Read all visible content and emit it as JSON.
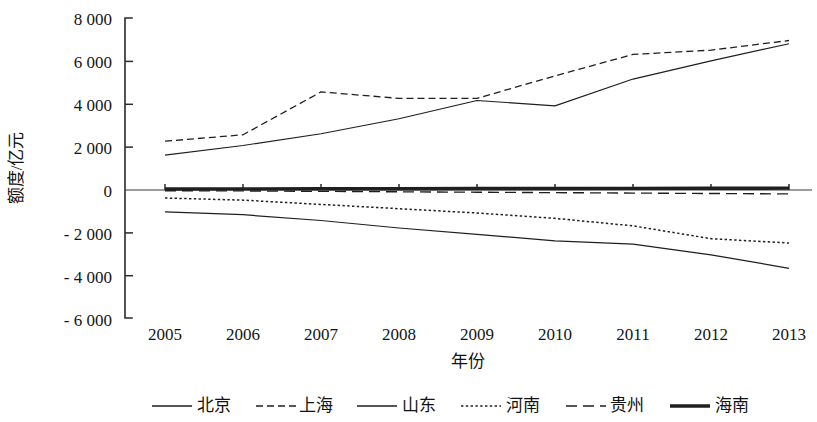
{
  "chart_data": {
    "type": "line",
    "title": "",
    "xlabel": "年份",
    "ylabel": "额度/亿元",
    "grid": false,
    "legend_position": "bottom",
    "x": [
      "2005",
      "2006",
      "2007",
      "2008",
      "2009",
      "2010",
      "2011",
      "2012",
      "2013"
    ],
    "xlim": [
      "2005",
      "2013"
    ],
    "ylim": [
      -6000,
      8000
    ],
    "yticks": [
      8000,
      6000,
      4000,
      2000,
      0,
      -2000,
      -4000,
      -6000
    ],
    "ytick_labels": [
      "8 000",
      "6 000",
      "4 000",
      "2 000",
      "0",
      "- 2 000",
      "- 4 000",
      "- 6 000"
    ],
    "series": [
      {
        "name": "北京",
        "style": "solid-thin",
        "values": [
          1600,
          2050,
          2600,
          3300,
          4150,
          3900,
          5150,
          6000,
          6800
        ]
      },
      {
        "name": "上海",
        "style": "dashed-short",
        "values": [
          2250,
          2550,
          4550,
          4250,
          4250,
          5300,
          6300,
          6500,
          6950
        ]
      },
      {
        "name": "山东",
        "style": "solid-medium",
        "values": [
          -1050,
          -1180,
          -1450,
          -1800,
          -2100,
          -2400,
          -2550,
          -3050,
          -3680
        ]
      },
      {
        "name": "河南",
        "style": "dotted",
        "values": [
          -400,
          -500,
          -700,
          -900,
          -1100,
          -1350,
          -1700,
          -2300,
          -2500
        ]
      },
      {
        "name": "贵州",
        "style": "dashed-long",
        "values": [
          -60,
          -70,
          -90,
          -110,
          -130,
          -150,
          -170,
          -190,
          -210
        ]
      },
      {
        "name": "海南",
        "style": "solid-thick",
        "values": [
          20,
          25,
          30,
          35,
          40,
          45,
          50,
          55,
          60
        ]
      }
    ]
  },
  "legend": {
    "items": [
      {
        "label": "北京"
      },
      {
        "label": "上海"
      },
      {
        "label": "山东"
      },
      {
        "label": "河南"
      },
      {
        "label": "贵州"
      },
      {
        "label": "海南"
      }
    ]
  }
}
